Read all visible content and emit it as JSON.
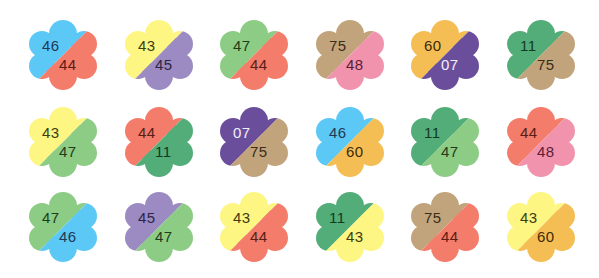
{
  "palette": {
    "blue": "#5BC8F5",
    "salmon": "#F47C6A",
    "yellow": "#FDF683",
    "purple": "#9B8BC2",
    "green": "#8DCC85",
    "tan": "#C2A47C",
    "pink": "#F293AE",
    "orange": "#F5BE55",
    "violet": "#6A4E9C",
    "darkgreen": "#53AD79"
  },
  "flowers": [
    {
      "top": {
        "value": "46",
        "color": "#5BC8F5",
        "text": "#1f3a55"
      },
      "bottom": {
        "value": "44",
        "color": "#F47C6A",
        "text": "#5a1e15"
      }
    },
    {
      "top": {
        "value": "43",
        "color": "#FDF683",
        "text": "#3d3d10"
      },
      "bottom": {
        "value": "45",
        "color": "#9B8BC2",
        "text": "#2d2545"
      }
    },
    {
      "top": {
        "value": "47",
        "color": "#8DCC85",
        "text": "#1e3d1a"
      },
      "bottom": {
        "value": "44",
        "color": "#F47C6A",
        "text": "#5a1e15"
      }
    },
    {
      "top": {
        "value": "75",
        "color": "#C2A47C",
        "text": "#3b2d18"
      },
      "bottom": {
        "value": "48",
        "color": "#F293AE",
        "text": "#5a1e35"
      }
    },
    {
      "top": {
        "value": "60",
        "color": "#F5BE55",
        "text": "#3d2a05"
      },
      "bottom": {
        "value": "07",
        "color": "#6A4E9C",
        "text": "#f2eefa"
      }
    },
    {
      "top": {
        "value": "11",
        "color": "#53AD79",
        "text": "#123a22"
      },
      "bottom": {
        "value": "75",
        "color": "#C2A47C",
        "text": "#3b2d18"
      }
    },
    {
      "top": {
        "value": "43",
        "color": "#FDF683",
        "text": "#3d3d10"
      },
      "bottom": {
        "value": "47",
        "color": "#8DCC85",
        "text": "#1e3d1a"
      }
    },
    {
      "top": {
        "value": "44",
        "color": "#F47C6A",
        "text": "#5a1e15"
      },
      "bottom": {
        "value": "11",
        "color": "#53AD79",
        "text": "#123a22"
      }
    },
    {
      "top": {
        "value": "07",
        "color": "#6A4E9C",
        "text": "#f2eefa"
      },
      "bottom": {
        "value": "75",
        "color": "#C2A47C",
        "text": "#3b2d18"
      }
    },
    {
      "top": {
        "value": "46",
        "color": "#5BC8F5",
        "text": "#1f3a55"
      },
      "bottom": {
        "value": "60",
        "color": "#F5BE55",
        "text": "#3d2a05"
      }
    },
    {
      "top": {
        "value": "11",
        "color": "#53AD79",
        "text": "#123a22"
      },
      "bottom": {
        "value": "47",
        "color": "#8DCC85",
        "text": "#1e3d1a"
      }
    },
    {
      "top": {
        "value": "44",
        "color": "#F47C6A",
        "text": "#5a1e15"
      },
      "bottom": {
        "value": "48",
        "color": "#F293AE",
        "text": "#5a1e35"
      }
    },
    {
      "top": {
        "value": "47",
        "color": "#8DCC85",
        "text": "#1e3d1a"
      },
      "bottom": {
        "value": "46",
        "color": "#5BC8F5",
        "text": "#1f3a55"
      }
    },
    {
      "top": {
        "value": "45",
        "color": "#9B8BC2",
        "text": "#2d2545"
      },
      "bottom": {
        "value": "47",
        "color": "#8DCC85",
        "text": "#1e3d1a"
      }
    },
    {
      "top": {
        "value": "43",
        "color": "#FDF683",
        "text": "#3d3d10"
      },
      "bottom": {
        "value": "44",
        "color": "#F47C6A",
        "text": "#5a1e15"
      }
    },
    {
      "top": {
        "value": "11",
        "color": "#53AD79",
        "text": "#123a22"
      },
      "bottom": {
        "value": "43",
        "color": "#FDF683",
        "text": "#3d3d10"
      }
    },
    {
      "top": {
        "value": "75",
        "color": "#C2A47C",
        "text": "#3b2d18"
      },
      "bottom": {
        "value": "44",
        "color": "#F47C6A",
        "text": "#5a1e15"
      }
    },
    {
      "top": {
        "value": "43",
        "color": "#FDF683",
        "text": "#3d3d10"
      },
      "bottom": {
        "value": "60",
        "color": "#F5BE55",
        "text": "#3d2a05"
      }
    }
  ]
}
